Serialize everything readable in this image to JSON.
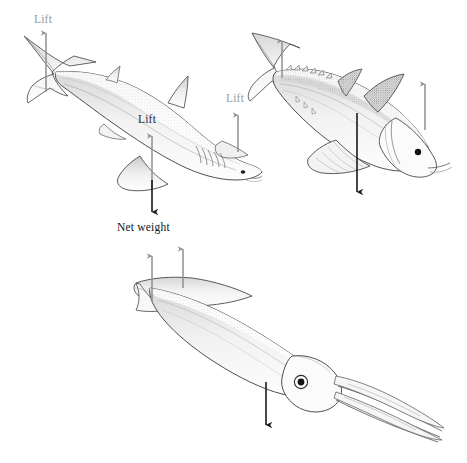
{
  "figure": {
    "background_color": "#ffffff",
    "ink_color": "#3a3a3a",
    "arrow_lift_color": "#8f8f8f",
    "arrow_weight_color": "#1a1a1a",
    "label_gray_color": "#9a9a9a",
    "label_black_color": "#141414"
  },
  "labels": {
    "shark_tail_lift": "Lift",
    "shark_body_lift": "Lift",
    "shark_pectoral_lift": "Lift",
    "shark_net_weight": "Net weight"
  },
  "panels": [
    {
      "id": "shark",
      "animal": "shark",
      "labels_visible": [
        "Lift",
        "Lift",
        "Lift",
        "Net weight"
      ]
    },
    {
      "id": "tuna",
      "animal": "tuna",
      "labels_visible": []
    },
    {
      "id": "squid",
      "animal": "squid",
      "labels_visible": []
    }
  ],
  "arrows": {
    "shark": [
      {
        "name": "tail-lift-arrow",
        "direction": "up",
        "color": "#8f8f8f"
      },
      {
        "name": "body-lift-arrow",
        "direction": "up",
        "color": "#8f8f8f"
      },
      {
        "name": "pectoral-lift-arrow",
        "direction": "up",
        "color": "#8f8f8f"
      },
      {
        "name": "net-weight-arrow",
        "direction": "down",
        "color": "#1a1a1a"
      }
    ],
    "tuna": [
      {
        "name": "tail-lift-arrow",
        "direction": "up",
        "color": "#8f8f8f"
      },
      {
        "name": "pectoral-lift-arrow",
        "direction": "up",
        "color": "#8f8f8f"
      },
      {
        "name": "net-weight-arrow",
        "direction": "down",
        "color": "#1a1a1a"
      }
    ],
    "squid": [
      {
        "name": "fin-lift-arrow-left",
        "direction": "up",
        "color": "#8f8f8f"
      },
      {
        "name": "fin-lift-arrow-right",
        "direction": "up",
        "color": "#8f8f8f"
      },
      {
        "name": "net-weight-arrow",
        "direction": "down",
        "color": "#1a1a1a"
      }
    ]
  }
}
